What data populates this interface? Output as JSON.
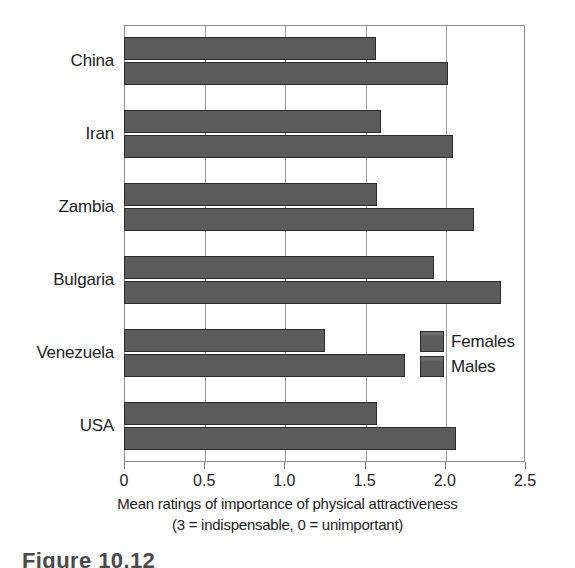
{
  "chart_data": {
    "type": "bar",
    "orientation": "horizontal",
    "title": "",
    "xlabel": "Mean ratings of importance of physical attractiveness",
    "xlabel_line2": "(3 = indispensable, 0 = unimportant)",
    "ylabel": "",
    "xlim": [
      0,
      2.5
    ],
    "xticks": [
      0,
      0.5,
      1.0,
      1.5,
      2.0,
      2.5
    ],
    "xtick_labels": [
      "0",
      "0.5",
      "1.0",
      "1.5",
      "2.0",
      "2.5"
    ],
    "grid": "vertical",
    "legend_position": "inside-right",
    "categories": [
      "China",
      "Iran",
      "Zambia",
      "Bulgaria",
      "Venezuela",
      "USA"
    ],
    "series": [
      {
        "name": "Females",
        "color": "#5b5b5b",
        "values": [
          1.57,
          1.6,
          1.58,
          1.93,
          1.25,
          1.58
        ]
      },
      {
        "name": "Males",
        "color": "#5b5b5b",
        "values": [
          2.02,
          2.05,
          2.18,
          2.35,
          1.75,
          2.07
        ]
      }
    ]
  },
  "legend": {
    "entries": [
      {
        "label": "Females"
      },
      {
        "label": "Males"
      }
    ]
  },
  "caption": {
    "text": "Figure 10.12"
  },
  "colors": {
    "bar_fill": "#5b5b5b",
    "bar_edge": "#2b2b2b",
    "frame": "#8c8c8c",
    "gridline": "#9a9a9a",
    "text": "#1d1d1d",
    "background": "#ffffff"
  }
}
